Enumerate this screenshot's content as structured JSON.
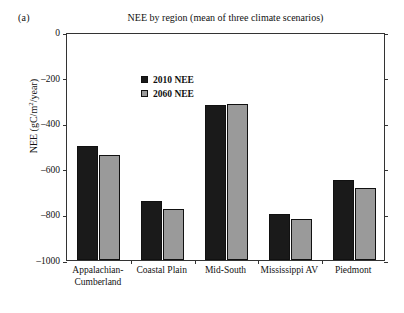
{
  "panel_label": "(a)",
  "chart_data": {
    "type": "bar",
    "title": "NEE by region (mean of three climate scenarios)",
    "xlabel": "",
    "ylabel": "NEE (gC/m2/year)",
    "ylabel_parts": {
      "pre": "NEE (gC/m",
      "sup": "2",
      "post": "/year)"
    },
    "ylim": [
      -1000,
      0
    ],
    "yticks": [
      0,
      -200,
      -400,
      -600,
      -800,
      -1000
    ],
    "ytick_labels": [
      "0",
      "–200",
      "–400",
      "–600",
      "–800",
      "–1000"
    ],
    "grid": false,
    "legend_position": "top-left-inside",
    "categories": [
      "Appalachian-\nCumberland",
      "Coastal Plain",
      "Mid-South",
      "Mississippi AV",
      "Piedmont"
    ],
    "series": [
      {
        "name": "2010 NEE",
        "color": "#1a1a1a",
        "values": [
          -500,
          -740,
          -320,
          -800,
          -650
        ]
      },
      {
        "name": "2060 NEE",
        "color": "#9a9a9a",
        "values": [
          -540,
          -775,
          -315,
          -820,
          -685
        ]
      }
    ]
  }
}
